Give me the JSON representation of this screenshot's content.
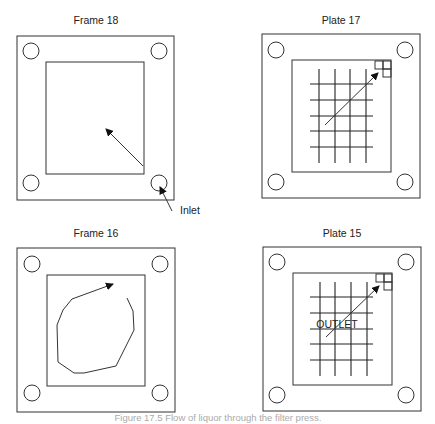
{
  "panels": [
    {
      "title": "Frame 18",
      "type": "frame",
      "flow": "diagonal arrow from inlet (bottom-right) toward center"
    },
    {
      "title": "Plate 17",
      "type": "plate",
      "flow": "diagonal arrow across grid toward top-right outlet"
    },
    {
      "title": "Frame 16",
      "type": "frame",
      "flow": "circular swirl arrow"
    },
    {
      "title": "Plate 15",
      "type": "plate",
      "flow": "diagonal arrow across grid toward top-right outlet"
    }
  ],
  "annotations": {
    "inlet": "Inlet",
    "outlet": "OUTLET"
  },
  "caption": "Figure 17.5 Flow of liquor through the filter press."
}
